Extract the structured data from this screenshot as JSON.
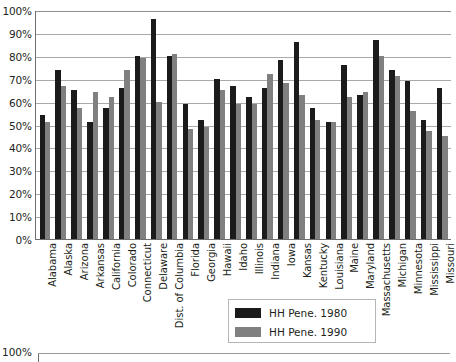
{
  "chart_data": {
    "type": "bar",
    "title": "",
    "xlabel": "",
    "ylabel": "",
    "ylim": [
      0,
      100
    ],
    "y_tick_labels": [
      "100%",
      "90%",
      "80%",
      "70%",
      "60%",
      "50%",
      "40%",
      "30%",
      "20%",
      "10%",
      "0%"
    ],
    "y_tick_values": [
      100,
      90,
      80,
      70,
      60,
      50,
      40,
      30,
      20,
      10,
      0
    ],
    "grid": true,
    "legend_position": "bottom-center",
    "categories": [
      "Alabama",
      "Alaska",
      "Arizona",
      "Arkansas",
      "California",
      "Colorado",
      "Connecticut",
      "Delaware",
      "Dist. of Columbia",
      "Florida",
      "Georgia",
      "Hawaii",
      "Idaho",
      "Illinois",
      "Indiana",
      "Iowa",
      "Kansas",
      "Kentucky",
      "Louisiana",
      "Maine",
      "Maryland",
      "Massachusetts",
      "Michigan",
      "Minnesota",
      "Mississippi",
      "Missouri"
    ],
    "series": [
      {
        "name": "HH Pene. 1980",
        "color": "#1b1b1b",
        "values": [
          54,
          74,
          65,
          51,
          57,
          66,
          80,
          96,
          80,
          59,
          52,
          70,
          67,
          62,
          66,
          78,
          86,
          57,
          51,
          76,
          63,
          87,
          74,
          69,
          52,
          66
        ]
      },
      {
        "name": "HH Pene. 1990",
        "color": "#808080",
        "values": [
          51,
          67,
          57,
          64,
          62,
          74,
          79,
          60,
          81,
          48,
          49,
          65,
          59,
          59,
          72,
          68,
          63,
          52,
          51,
          62,
          64,
          80,
          71,
          56,
          47,
          45
        ]
      }
    ]
  },
  "legend": {
    "items": [
      {
        "label": "HH Pene. 1980",
        "color": "#1b1b1b"
      },
      {
        "label": "HH Pene. 1990",
        "color": "#808080"
      }
    ]
  },
  "next_chart": {
    "y_top_label": "100%"
  },
  "colors": {
    "series_1980": "#1b1b1b",
    "series_1990": "#808080",
    "gridline": "#a9a9a9",
    "axis": "#6f6f6f",
    "text": "#231f20",
    "background": "#ffffff"
  }
}
